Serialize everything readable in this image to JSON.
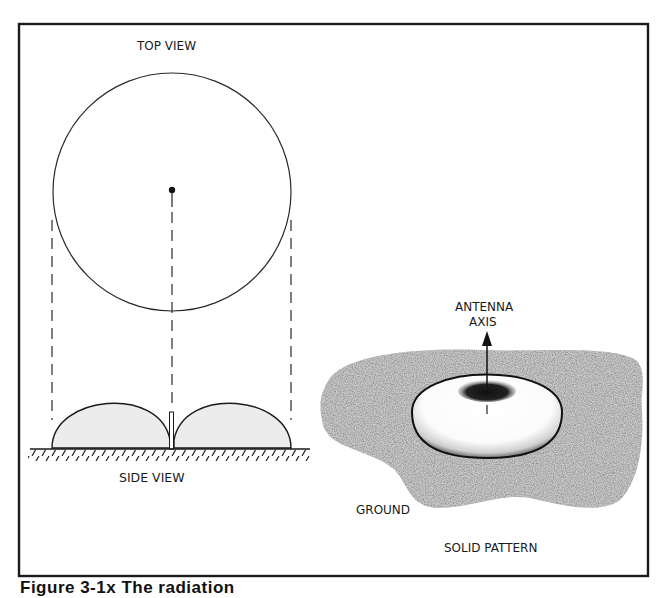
{
  "figure": {
    "labels": {
      "top_view": "TOP VIEW",
      "side_view": "SIDE VIEW",
      "antenna_axis_line1": "ANTENNA",
      "antenna_axis_line2": "AXIS",
      "ground": "GROUND",
      "solid_pattern": "SOLID PATTERN"
    },
    "caption": "Figure 3-1x  The radiation"
  },
  "colors": {
    "ink": "#1a1a1a",
    "lobe_fill": "#ececec",
    "ground_fill": "#c9c9c9",
    "background": "#ffffff"
  }
}
